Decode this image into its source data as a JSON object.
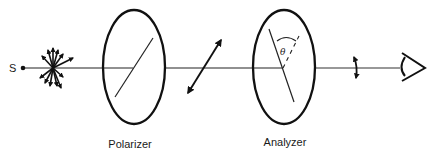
{
  "diagram": {
    "source": {
      "label": "S"
    },
    "polarizer": {
      "label": "Polarizer"
    },
    "analyzer": {
      "label": "Analyzer",
      "angle_symbol": "θ"
    },
    "icons": {
      "unpolarized_light": "starburst-arrows-icon",
      "polarized_light": "diagonal-double-arrow-icon",
      "transmitted_light": "short-double-arrow-icon",
      "observer": "eye-icon"
    },
    "colors": {
      "stroke": "#111111",
      "background": "#ffffff"
    }
  }
}
